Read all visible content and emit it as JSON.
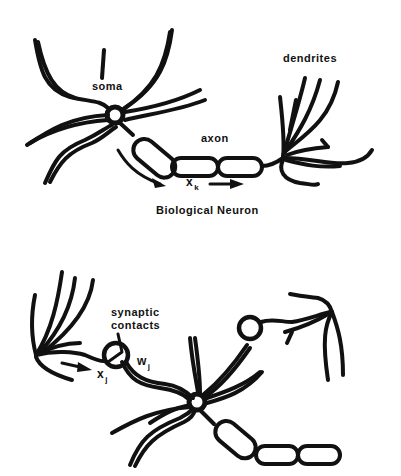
{
  "diagram": {
    "colors": {
      "ink": "#111111",
      "background": "#ffffff"
    },
    "top_panel": {
      "title": "Biological Neuron",
      "labels": {
        "soma": "soma",
        "axon": "axon",
        "dendrites": "dendrites",
        "signal": "x",
        "signal_sub": "k"
      }
    },
    "bottom_panel": {
      "labels": {
        "synapse_line1": "synaptic",
        "synapse_line2": "contacts",
        "weight": "w",
        "weight_sub": "j",
        "input": "x",
        "input_sub": "j"
      }
    }
  }
}
